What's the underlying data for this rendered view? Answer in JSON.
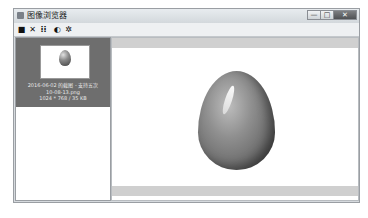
{
  "window": {
    "title": "图像浏览器",
    "controls": {
      "minimize": "—",
      "maximize": "□",
      "close": "✕"
    }
  },
  "toolbar": {
    "items": [
      {
        "name": "save-icon",
        "glyph": "■"
      },
      {
        "name": "delete-icon",
        "glyph": "✕"
      },
      {
        "name": "grid-icon",
        "glyph": "⁞⁞"
      },
      {
        "name": "info-icon",
        "glyph": "◐"
      },
      {
        "name": "settings-icon",
        "glyph": "✲"
      }
    ]
  },
  "thumbnails": [
    {
      "selected": true,
      "caption_line1": "2016-06-02 的截图 - 支持五次",
      "caption_line2": "10-08-13.png",
      "caption_line3": "1024 * 768 / 35 KB"
    }
  ],
  "colors": {
    "selected_bg": "#6e6e6e",
    "viewer_bg": "#ffffff",
    "frame": "#d6dade"
  }
}
